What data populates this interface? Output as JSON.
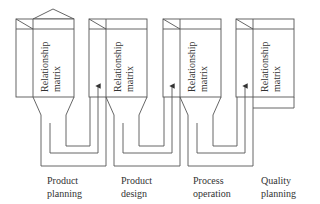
{
  "diagram": {
    "type": "QFD four-phase cascade of relationship matrices",
    "matrices": [
      {
        "id": "m1",
        "label_line1": "Relationship",
        "label_line2": "matrix",
        "has_roof": true
      },
      {
        "id": "m2",
        "label_line1": "Relationship",
        "label_line2": "matrix",
        "has_roof": false
      },
      {
        "id": "m3",
        "label_line1": "Relationship",
        "label_line2": "matrix",
        "has_roof": false
      },
      {
        "id": "m4",
        "label_line1": "Relationship",
        "label_line2": "matrix",
        "has_roof": false
      }
    ],
    "phases": [
      {
        "line1": "Product",
        "line2": "planning"
      },
      {
        "line1": "Product",
        "line2": "design"
      },
      {
        "line1": "Process",
        "line2": "operation"
      },
      {
        "line1": "Quality",
        "line2": "planning"
      }
    ],
    "connectors": [
      {
        "from": "m1",
        "to": "m2",
        "arrow": "up"
      },
      {
        "from": "m2",
        "to": "m3",
        "arrow": "up"
      },
      {
        "from": "m3",
        "to": "m4",
        "arrow": "up"
      }
    ],
    "colors": {
      "line": "#555555",
      "text": "#333333",
      "background": "#ffffff"
    }
  }
}
